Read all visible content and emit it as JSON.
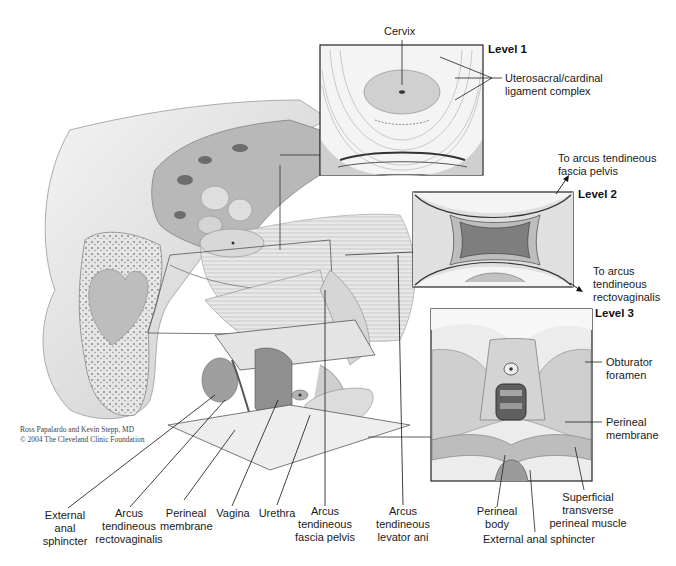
{
  "figure": {
    "credit": {
      "line1": "Ross Papalardo and Kevin Stepp, MD",
      "line2": "© 2004 The Cleveland Clinic Foundation"
    },
    "insets": [
      {
        "level_label": "Level 1",
        "labels": [
          "Cervix",
          "Uterosacral/cardinal",
          "ligament complex"
        ]
      },
      {
        "level_label": "Level 2",
        "labels": [
          "To arcus tendineous",
          "fascia pelvis",
          "To arcus",
          "tendineous",
          "rectovaginalis"
        ]
      },
      {
        "level_label": "Level 3",
        "labels": [
          "Obturator",
          "foramen",
          "Perineal",
          "membrane",
          "Superficial",
          "transverse",
          "perineal muscle",
          "Perineal",
          "body",
          "External anal sphincter"
        ]
      }
    ],
    "bottom_labels": [
      {
        "lines": [
          "External",
          "anal",
          "sphincter"
        ]
      },
      {
        "lines": [
          "Arcus",
          "tendineous",
          "rectovaginalis"
        ]
      },
      {
        "lines": [
          "Perineal",
          "membrane"
        ]
      },
      {
        "lines": [
          "Vagina"
        ]
      },
      {
        "lines": [
          "Urethra"
        ]
      },
      {
        "lines": [
          "Arcus",
          "tendineous",
          "fascia pelvis"
        ]
      },
      {
        "lines": [
          "Arcus",
          "tendineous",
          "levator ani"
        ]
      }
    ]
  }
}
